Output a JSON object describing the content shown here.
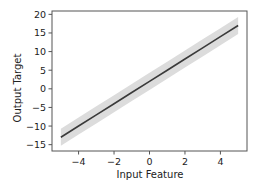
{
  "chart_data": {
    "type": "line",
    "title": "",
    "xlabel": "Input Feature",
    "ylabel": "Output Target",
    "xlim": [
      -5.5,
      5.5
    ],
    "ylim": [
      -16.7,
      20.9
    ],
    "xticks": [
      -4,
      -2,
      0,
      2,
      4
    ],
    "xtick_labels": [
      "−4",
      "−2",
      "0",
      "2",
      "4"
    ],
    "yticks": [
      -15,
      -10,
      -5,
      0,
      5,
      10,
      15,
      20
    ],
    "ytick_labels": [
      "−15",
      "−10",
      "−5",
      "0",
      "5",
      "10",
      "15",
      "20"
    ],
    "grid": false,
    "legend": null,
    "series": [
      {
        "name": "fit",
        "x": [
          -5,
          -4,
          -3,
          -2,
          -1,
          0,
          1,
          2,
          3,
          4,
          5
        ],
        "y": [
          -13,
          -10,
          -7,
          -4,
          -1,
          2,
          5,
          8,
          11,
          14,
          17
        ],
        "band_lower": [
          -15.3,
          -12.3,
          -9.3,
          -6.3,
          -3.3,
          -0.3,
          2.7,
          5.7,
          8.7,
          11.7,
          14.7
        ],
        "band_upper": [
          -10.7,
          -7.7,
          -4.7,
          -1.7,
          1.3,
          4.3,
          7.3,
          10.3,
          13.3,
          16.3,
          19.3
        ],
        "line_color": "#3a3a3a",
        "band_color": "#dcdcdc"
      }
    ]
  },
  "frame": {
    "color": "#555555"
  }
}
